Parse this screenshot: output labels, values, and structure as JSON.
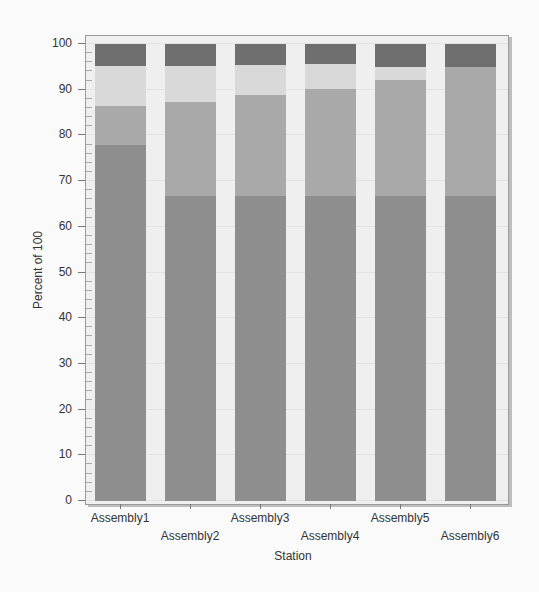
{
  "chart_data": {
    "type": "bar",
    "stacked": true,
    "title": "",
    "xlabel": "Station",
    "ylabel": "Percent of 100",
    "ylim": [
      0,
      100
    ],
    "yticks": [
      0,
      10,
      20,
      30,
      40,
      50,
      60,
      70,
      80,
      90,
      100
    ],
    "grid": true,
    "legend": null,
    "categories": [
      "Assembly1",
      "Assembly2",
      "Assembly3",
      "Assembly4",
      "Assembly5",
      "Assembly6"
    ],
    "series": [
      {
        "name": "segment1 (bottom)",
        "color": "#8e8e8e",
        "values": [
          78.0,
          66.7,
          66.7,
          66.7,
          66.7,
          66.7
        ]
      },
      {
        "name": "segment2",
        "color": "#a9a9a9",
        "values": [
          8.4,
          20.6,
          22.1,
          23.5,
          25.4,
          28.3
        ]
      },
      {
        "name": "segment3",
        "color": "#d9d9d9",
        "values": [
          8.8,
          7.9,
          6.6,
          5.4,
          2.9,
          0.0
        ]
      },
      {
        "name": "segment4 (top)",
        "color": "#6f6f6f",
        "values": [
          4.8,
          4.8,
          4.6,
          4.4,
          5.0,
          5.0
        ]
      }
    ]
  }
}
